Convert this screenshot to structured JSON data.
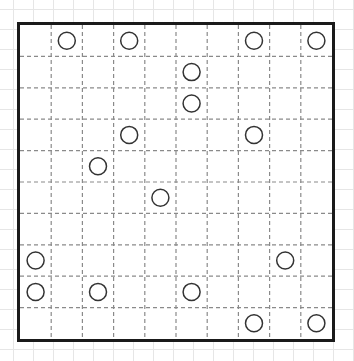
{
  "puzzle": {
    "rows": 10,
    "cols": 10,
    "colors": {
      "border": "#1a1a1a",
      "grid_line": "#8a8a8a",
      "circle_stroke": "#333333",
      "background_grid": "#e6e6e6"
    },
    "circles": [
      {
        "row": 0,
        "col": 1
      },
      {
        "row": 0,
        "col": 3
      },
      {
        "row": 0,
        "col": 7
      },
      {
        "row": 0,
        "col": 9
      },
      {
        "row": 1,
        "col": 5
      },
      {
        "row": 2,
        "col": 5
      },
      {
        "row": 3,
        "col": 3
      },
      {
        "row": 3,
        "col": 7
      },
      {
        "row": 4,
        "col": 2
      },
      {
        "row": 5,
        "col": 4
      },
      {
        "row": 7,
        "col": 0
      },
      {
        "row": 7,
        "col": 8
      },
      {
        "row": 8,
        "col": 0
      },
      {
        "row": 8,
        "col": 2
      },
      {
        "row": 8,
        "col": 5
      },
      {
        "row": 9,
        "col": 7
      },
      {
        "row": 9,
        "col": 9
      }
    ]
  }
}
